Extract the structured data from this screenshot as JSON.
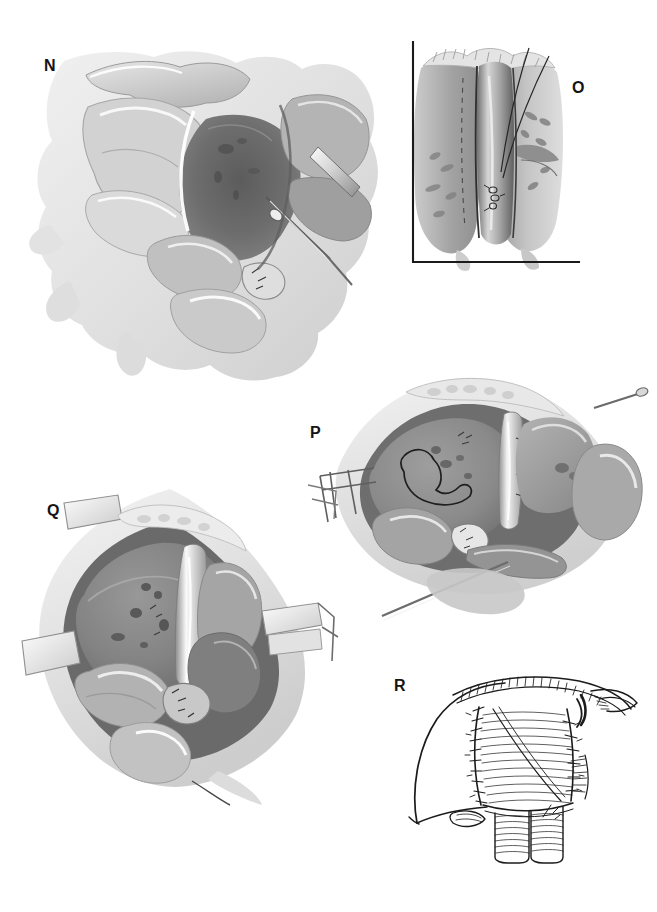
{
  "plate": {
    "kind": "surgical-atlas-plate",
    "background_color": "#ffffff",
    "ink_color": "#1a1a1a",
    "medium": "grayscale wash with pen-and-ink line work",
    "panel_count": 5
  },
  "labels": {
    "n": "N",
    "o": "O",
    "p": "P",
    "q": "Q",
    "r": "R"
  },
  "panels": [
    {
      "id": "n",
      "label": "N",
      "label_x": 44,
      "label_y": 58,
      "style": "wash",
      "framed": false,
      "bounds": {
        "x": 40,
        "y": 50,
        "w": 360,
        "h": 330
      },
      "description": "Operative field, retracted wound with deep dark viscus and long instrument"
    },
    {
      "id": "o",
      "label": "O",
      "label_x": 572,
      "label_y": 80,
      "style": "wash",
      "framed": true,
      "frame": {
        "vx": 412,
        "vy1": 43,
        "vy2": 262,
        "hx2": 578,
        "hy": 262
      },
      "bounds": {
        "x": 412,
        "y": 43,
        "w": 168,
        "h": 225
      },
      "description": "Close-up of midline structure with two suture tails, framed by L-shaped rule"
    },
    {
      "id": "p",
      "label": "P",
      "label_x": 310,
      "label_y": 425,
      "style": "wash",
      "framed": false,
      "bounds": {
        "x": 320,
        "y": 375,
        "w": 320,
        "h": 245
      },
      "description": "Opened cavity with retractors, large organ mass and inked outline marking"
    },
    {
      "id": "q",
      "label": "Q",
      "label_x": 47,
      "label_y": 503,
      "style": "wash",
      "framed": false,
      "bounds": {
        "x": 30,
        "y": 490,
        "w": 300,
        "h": 310
      },
      "description": "Rhomboid wound with self-retaining retractor blades and abdominal contents"
    },
    {
      "id": "r",
      "label": "R",
      "label_x": 394,
      "label_y": 678,
      "style": "line",
      "framed": false,
      "bounds": {
        "x": 395,
        "y": 670,
        "w": 240,
        "h": 185
      },
      "description": "Pen-and-ink line drawing of completed closure with running suture line and tubes"
    }
  ]
}
